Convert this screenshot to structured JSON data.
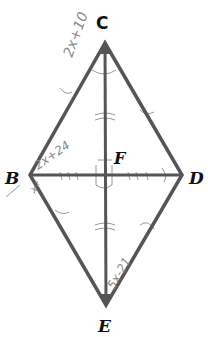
{
  "diagram": {
    "shape": "rhombus",
    "vertices": {
      "C": {
        "label": "C",
        "x": 105,
        "y": 43
      },
      "B": {
        "label": "B",
        "x": 30,
        "y": 175
      },
      "D": {
        "label": "D",
        "x": 182,
        "y": 175
      },
      "E": {
        "label": "E",
        "x": 106,
        "y": 305
      }
    },
    "intersection": {
      "label": "F",
      "x": 105,
      "y": 175
    },
    "annotations": {
      "ce_side": "2x+10",
      "bc_side": "2x+24",
      "bf_segment": "x²",
      "de_side": "5x-21"
    },
    "colors": {
      "line": "#555555",
      "label": "#111111",
      "handwriting": "#8a8a8a"
    }
  }
}
